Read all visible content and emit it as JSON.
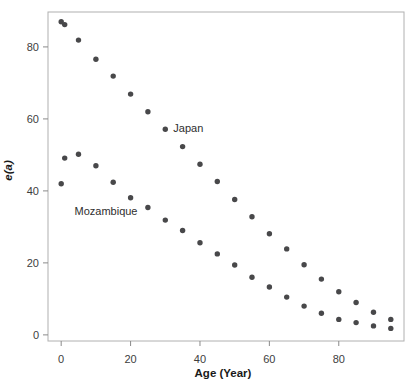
{
  "chart_data": {
    "type": "scatter",
    "title": "",
    "xlabel": "Age (Year)",
    "ylabel": "e(a)",
    "x": [
      0,
      1,
      5,
      10,
      15,
      20,
      25,
      30,
      35,
      40,
      45,
      50,
      55,
      60,
      65,
      70,
      75,
      80,
      85,
      90,
      95
    ],
    "series": [
      {
        "name": "Japan",
        "values": [
          87.0,
          86.2,
          81.9,
          76.6,
          71.9,
          66.9,
          62.0,
          57.1,
          52.3,
          47.4,
          42.6,
          37.6,
          32.8,
          28.1,
          23.9,
          19.5,
          15.5,
          12.0,
          9.0,
          6.3,
          4.3
        ]
      },
      {
        "name": "Mozambique",
        "values": [
          42.0,
          49.1,
          50.2,
          47.0,
          42.4,
          38.1,
          35.4,
          31.9,
          29.0,
          25.6,
          22.5,
          19.4,
          16.0,
          13.3,
          10.5,
          8.0,
          6.0,
          4.3,
          3.4,
          2.5,
          1.8
        ]
      }
    ],
    "xlim": [
      -3.8,
      98.8
    ],
    "ylim": [
      -1.7,
      89.7
    ],
    "xticks": [
      0,
      20,
      40,
      60,
      80
    ],
    "yticks": [
      0,
      20,
      40,
      60,
      80
    ],
    "grid": false,
    "legend": "inline-annotations",
    "annotations": [
      {
        "text": "Japan",
        "age": 32.3,
        "value": 57.3,
        "anchor": "start"
      },
      {
        "text": "Mozambique",
        "age": 22.0,
        "value": 34.3,
        "anchor": "end"
      }
    ],
    "colors": {
      "point": "#48484a",
      "frame": "#b0b0b0",
      "tick": "#8a8a8a",
      "tick_label": "#3d3d3d",
      "axis_title": "#1a1a1a",
      "series_label": "#2e2e2e",
      "background": "#ffffff"
    }
  }
}
